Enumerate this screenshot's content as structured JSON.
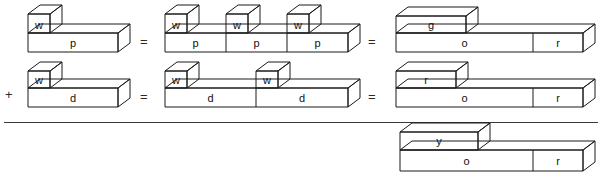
{
  "diagram": {
    "operators": {
      "plus": "+",
      "equals": "="
    },
    "rows": [
      {
        "id": "row-1",
        "leading_operator": "",
        "groups": [
          {
            "id": "row1-left",
            "blocks": [
              {
                "id": "w-cube",
                "label": "w",
                "shape": "cube"
              },
              {
                "id": "p-bar",
                "label": "p",
                "shape": "bar"
              }
            ]
          },
          {
            "id": "row1-middle",
            "blocks": [
              {
                "id": "w-cube-1",
                "label": "w",
                "shape": "cube"
              },
              {
                "id": "p-bar-1",
                "label": "p",
                "shape": "bar"
              },
              {
                "id": "w-cube-2",
                "label": "w",
                "shape": "cube"
              },
              {
                "id": "p-bar-2",
                "label": "p",
                "shape": "bar"
              },
              {
                "id": "w-cube-3",
                "label": "w",
                "shape": "cube"
              },
              {
                "id": "p-bar-3",
                "label": "p",
                "shape": "bar"
              }
            ]
          },
          {
            "id": "row1-right",
            "blocks": [
              {
                "id": "g-block",
                "label": "g",
                "shape": "flat-box"
              },
              {
                "id": "o-bar",
                "label": "o",
                "shape": "bar"
              },
              {
                "id": "r-bar",
                "label": "r",
                "shape": "bar"
              }
            ]
          }
        ]
      },
      {
        "id": "row-2",
        "leading_operator": "+",
        "groups": [
          {
            "id": "row2-left",
            "blocks": [
              {
                "id": "w-cube",
                "label": "w",
                "shape": "cube"
              },
              {
                "id": "d-bar",
                "label": "d",
                "shape": "bar"
              }
            ]
          },
          {
            "id": "row2-middle",
            "blocks": [
              {
                "id": "w-cube-1",
                "label": "w",
                "shape": "cube"
              },
              {
                "id": "d-bar-1",
                "label": "d",
                "shape": "bar"
              },
              {
                "id": "w-cube-2",
                "label": "w",
                "shape": "cube"
              },
              {
                "id": "d-bar-2",
                "label": "d",
                "shape": "bar"
              }
            ]
          },
          {
            "id": "row2-right",
            "blocks": [
              {
                "id": "r-block",
                "label": "r",
                "shape": "flat-box"
              },
              {
                "id": "o-bar",
                "label": "o",
                "shape": "bar"
              },
              {
                "id": "r-bar",
                "label": "r",
                "shape": "bar"
              }
            ]
          }
        ]
      },
      {
        "id": "row-3",
        "leading_operator": "",
        "groups": [
          {
            "id": "row3-result",
            "blocks": [
              {
                "id": "y-block",
                "label": "y",
                "shape": "flat-box"
              },
              {
                "id": "o-bar",
                "label": "o",
                "shape": "bar"
              },
              {
                "id": "r-bar",
                "label": "r",
                "shape": "bar"
              }
            ]
          }
        ]
      }
    ],
    "labels": {
      "w": "w",
      "p": "p",
      "d": "d",
      "g": "g",
      "o": "o",
      "r": "r",
      "y": "y"
    },
    "colors": {
      "stroke": "#1a1a1a",
      "fill": "#ffffff",
      "rule": "#3a3a3a",
      "text": "#111111"
    }
  }
}
